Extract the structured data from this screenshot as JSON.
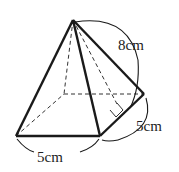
{
  "diagram": {
    "type": "square-pyramid",
    "labels": {
      "slant_height": "8cm",
      "base_edge_right": "5cm",
      "base_edge_front": "5cm"
    },
    "vertices": {
      "apex": [
        73,
        20
      ],
      "front_left": [
        16,
        136
      ],
      "front_right": [
        100,
        136
      ],
      "back_right": [
        144,
        94
      ],
      "back_left": [
        64,
        94
      ]
    },
    "slant_foot": [
      122,
      115
    ],
    "right_angle_marker": true,
    "colors": {
      "stroke": "#1a1a1a",
      "background": "#ffffff"
    }
  }
}
